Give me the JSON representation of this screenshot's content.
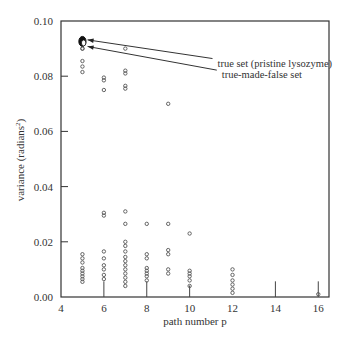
{
  "chart_data": {
    "type": "scatter",
    "title": "",
    "xlabel": "path number p",
    "ylabel": "variance (radians²)",
    "ylabel_main": "variance (radians",
    "ylabel_sup": "2",
    "ylabel_close": ")",
    "xlim": [
      4,
      16.5
    ],
    "ylim": [
      0.0,
      0.1
    ],
    "xticks": [
      4,
      6,
      8,
      10,
      12,
      14,
      16
    ],
    "xtick_labels": [
      "4",
      "6",
      "8",
      "10",
      "12",
      "14",
      "16"
    ],
    "yticks": [
      0.0,
      0.02,
      0.04,
      0.06,
      0.08,
      0.1
    ],
    "ytick_labels": [
      "0.00",
      "0.02",
      "0.04",
      "0.06",
      "0.08",
      "0.10"
    ],
    "grid": false,
    "annotations": [
      {
        "text": "true set (pristine lysozyme)",
        "arrow_to": [
          5.1,
          0.0928
        ],
        "text_at": [
          11.3,
          0.0835
        ]
      },
      {
        "text": "true-made-false set",
        "arrow_to": [
          5.1,
          0.0915
        ],
        "text_at": [
          11.5,
          0.0793
        ]
      }
    ],
    "highlight_points": [
      {
        "label": "true set (pristine lysozyme)",
        "x": 5,
        "y": 0.093
      },
      {
        "label": "true-made-false set",
        "x": 5,
        "y": 0.092
      }
    ],
    "stems": [
      {
        "x": 6,
        "y_top": 0.0035
      },
      {
        "x": 8,
        "y_top": 0.0035
      },
      {
        "x": 10,
        "y_top": 0.002
      },
      {
        "x": 14,
        "y_top": 0.0035
      },
      {
        "x": 16,
        "y_top": 0.0035
      }
    ],
    "series": [
      {
        "name": "variance by path number",
        "points": [
          [
            5,
            0.0935
          ],
          [
            5,
            0.093
          ],
          [
            5,
            0.0925
          ],
          [
            5,
            0.092
          ],
          [
            5,
            0.0915
          ],
          [
            5,
            0.09
          ],
          [
            5,
            0.0855
          ],
          [
            5,
            0.0835
          ],
          [
            5,
            0.0815
          ],
          [
            5,
            0.0155
          ],
          [
            5,
            0.014
          ],
          [
            5,
            0.0125
          ],
          [
            5,
            0.0105
          ],
          [
            5,
            0.0095
          ],
          [
            5,
            0.0085
          ],
          [
            5,
            0.0075
          ],
          [
            5,
            0.0065
          ],
          [
            5,
            0.0055
          ],
          [
            6,
            0.0795
          ],
          [
            6,
            0.0785
          ],
          [
            6,
            0.075
          ],
          [
            6,
            0.0305
          ],
          [
            6,
            0.0295
          ],
          [
            6,
            0.0165
          ],
          [
            6,
            0.014
          ],
          [
            6,
            0.0115
          ],
          [
            6,
            0.01
          ],
          [
            6,
            0.008
          ],
          [
            6,
            0.0065
          ],
          [
            7,
            0.09
          ],
          [
            7,
            0.082
          ],
          [
            7,
            0.081
          ],
          [
            7,
            0.0765
          ],
          [
            7,
            0.0755
          ],
          [
            7,
            0.031
          ],
          [
            7,
            0.0265
          ],
          [
            7,
            0.02
          ],
          [
            7,
            0.0185
          ],
          [
            7,
            0.0165
          ],
          [
            7,
            0.0145
          ],
          [
            7,
            0.013
          ],
          [
            7,
            0.0115
          ],
          [
            7,
            0.01
          ],
          [
            7,
            0.0085
          ],
          [
            7,
            0.007
          ],
          [
            7,
            0.0055
          ],
          [
            7,
            0.004
          ],
          [
            8,
            0.0265
          ],
          [
            8,
            0.0155
          ],
          [
            8,
            0.014
          ],
          [
            8,
            0.0105
          ],
          [
            8,
            0.0095
          ],
          [
            8,
            0.0085
          ],
          [
            8,
            0.0075
          ],
          [
            8,
            0.006
          ],
          [
            9,
            0.07
          ],
          [
            9,
            0.0265
          ],
          [
            9,
            0.017
          ],
          [
            9,
            0.0155
          ],
          [
            9,
            0.01
          ],
          [
            9,
            0.0085
          ],
          [
            10,
            0.023
          ],
          [
            10,
            0.0095
          ],
          [
            10,
            0.0085
          ],
          [
            10,
            0.0075
          ],
          [
            10,
            0.006
          ],
          [
            10,
            0.004
          ],
          [
            12,
            0.01
          ],
          [
            12,
            0.008
          ],
          [
            12,
            0.006
          ],
          [
            12,
            0.0045
          ],
          [
            12,
            0.003
          ],
          [
            12,
            0.0015
          ],
          [
            16,
            0.001
          ]
        ]
      }
    ]
  }
}
